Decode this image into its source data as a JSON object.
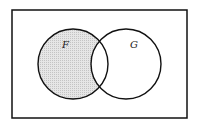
{
  "diagram": {
    "type": "venn",
    "universe": {
      "x": 12,
      "y": 10,
      "width": 175,
      "height": 108
    },
    "sets": [
      {
        "label": "F",
        "cx": 73,
        "cy": 64,
        "r": 35,
        "label_x": 64,
        "label_y": 46
      },
      {
        "label": "G",
        "cx": 126,
        "cy": 64,
        "r": 35,
        "label_x": 131,
        "label_y": 46
      }
    ],
    "shaded_region": "F minus G",
    "colors": {
      "stroke": "#111111",
      "shade": "#d9d9d9",
      "background": "#ffffff"
    }
  }
}
